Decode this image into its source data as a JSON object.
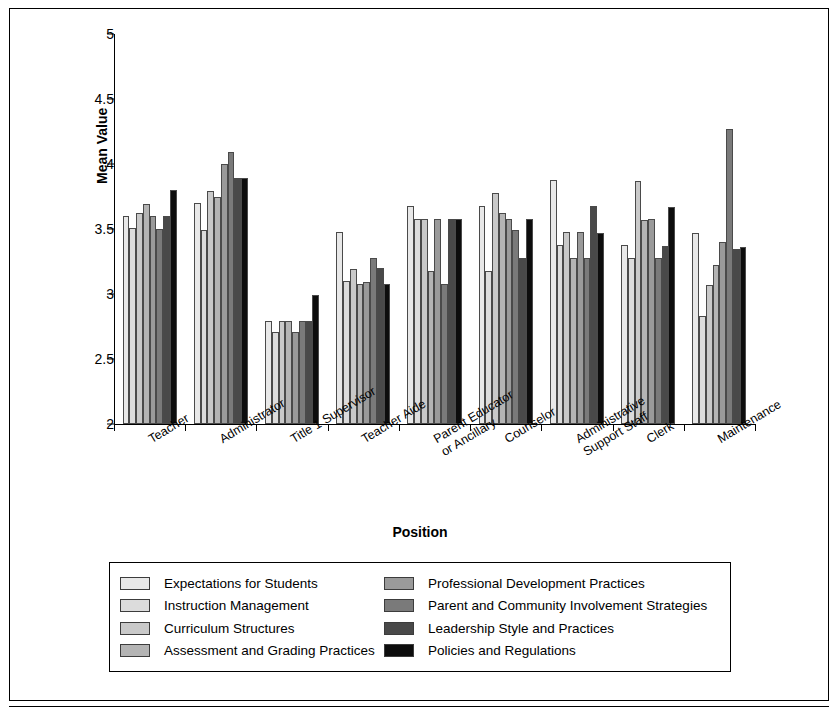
{
  "chart_data": {
    "type": "bar",
    "title": "",
    "xlabel": "Position",
    "ylabel": "Mean Value",
    "ylim": [
      2,
      5
    ],
    "yticks": [
      "2",
      "2.5",
      "3",
      "3.5",
      "4",
      "4.5",
      "5"
    ],
    "ytick_values": [
      2,
      2.5,
      3,
      3.5,
      4,
      4.5,
      5
    ],
    "grid": false,
    "legend_position": "bottom",
    "categories": [
      "Teacher",
      "Administrator",
      "Title 1 Supervisor",
      "Teacher Aide",
      "Parent Educator or Ancillary",
      "Counselor",
      "Administrative Support Staff",
      "Clerk",
      "Maintenance"
    ],
    "category_lines": [
      [
        "Teacher"
      ],
      [
        "Administrator"
      ],
      [
        "Title 1 Supervisor"
      ],
      [
        "Teacher Aide"
      ],
      [
        "Parent Educator",
        "or Ancillary"
      ],
      [
        "Counselor"
      ],
      [
        "Administrative",
        "Support Staff"
      ],
      [
        "Clerk"
      ],
      [
        "Maintenance"
      ]
    ],
    "series": [
      {
        "name": "Expectations for Students",
        "color": "#e8e8e8",
        "values": [
          3.6,
          3.7,
          2.79,
          3.48,
          3.68,
          3.68,
          3.88,
          3.38,
          3.47
        ]
      },
      {
        "name": "Instruction Management",
        "color": "#dcdcdc",
        "values": [
          3.51,
          3.49,
          2.71,
          3.1,
          3.58,
          3.18,
          3.38,
          3.28,
          2.83
        ]
      },
      {
        "name": "Curriculum Structures",
        "color": "#c9c9c9",
        "values": [
          3.62,
          3.79,
          2.79,
          3.19,
          3.58,
          3.78,
          3.48,
          3.87,
          3.07
        ]
      },
      {
        "name": "Assessment and Grading Practices",
        "color": "#b4b4b4",
        "values": [
          3.69,
          3.75,
          2.79,
          3.08,
          3.18,
          3.62,
          3.28,
          3.57,
          3.22
        ]
      },
      {
        "name": "Professional Development Practices",
        "color": "#9a9a9a",
        "values": [
          3.6,
          4.0,
          2.71,
          3.09,
          3.58,
          3.58,
          3.48,
          3.58,
          3.4
        ]
      },
      {
        "name": "Parent and Community Involvement Strategies",
        "color": "#7a7a7a",
        "values": [
          3.5,
          4.09,
          2.79,
          3.28,
          3.08,
          3.49,
          3.28,
          3.28,
          4.27
        ]
      },
      {
        "name": "Leadership Style and Practices",
        "color": "#494949",
        "values": [
          3.6,
          3.89,
          2.79,
          3.2,
          3.58,
          3.28,
          3.68,
          3.37,
          3.35
        ]
      },
      {
        "name": "Policies and Regulations",
        "color": "#0d0d0d",
        "values": [
          3.8,
          3.89,
          2.99,
          3.08,
          3.58,
          3.58,
          3.47,
          3.67,
          3.36
        ]
      }
    ]
  }
}
